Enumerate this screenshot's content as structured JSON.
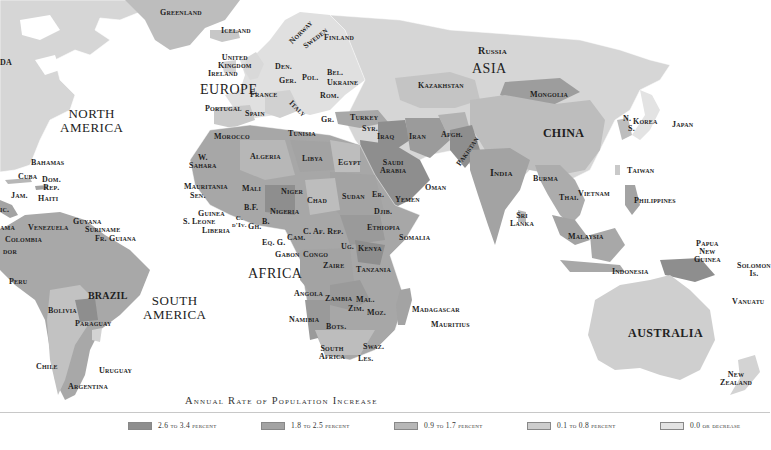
{
  "map": {
    "title": "Annual Rate of Population Increase",
    "colors": {
      "ocean": "#ffffff",
      "cat1": "#8e8e8e",
      "cat2": "#a3a3a3",
      "cat3": "#b7b7b7",
      "cat4": "#cdcdcd",
      "cat5": "#e3e3e3"
    },
    "continents": [
      {
        "id": "north-america",
        "text": "NORTH\nAMERICA"
      },
      {
        "id": "south-america",
        "text": "SOUTH\nAMERICA"
      },
      {
        "id": "europe",
        "text": "EUROPE"
      },
      {
        "id": "asia",
        "text": "ASIA"
      },
      {
        "id": "africa",
        "text": "AFRICA"
      },
      {
        "id": "australia",
        "text": "AUSTRALIA"
      }
    ],
    "countries": {
      "greenland": "Greenland",
      "iceland": "Iceland",
      "norway": "Norway",
      "sweden": "Sweden",
      "finland": "Finland",
      "uk": "United\nKingdom",
      "ireland": "Ireland",
      "den": "Den.",
      "ger": "Ger.",
      "pol": "Pol.",
      "bel": "Bel.",
      "ukraine": "Ukraine",
      "france": "France",
      "rom": "Rom.",
      "portugal": "Portugal",
      "spain": "Spain",
      "italy": "Italy",
      "gr": "Gr.",
      "turkey": "Turkey",
      "russia": "Russia",
      "kazakhstan": "Kazakhstan",
      "mongolia": "Mongolia",
      "china": "CHINA",
      "korea": "Korea",
      "n": "N.",
      "s": "S.",
      "japan": "Japan",
      "morocco": "Morocco",
      "tunisia": "Tunisia",
      "syr": "Syr.",
      "iraq": "Iraq",
      "iran": "Iran",
      "afgh": "Afgh.",
      "pakistan": "Pakistan",
      "india": "India",
      "w_sahara": "W.\nSahara",
      "algeria": "Algeria",
      "libya": "Libya",
      "egypt": "Egypt",
      "saudi": "Saudi\nArabia",
      "oman": "Oman",
      "yemen": "Yemen",
      "mauritania": "Mauritania",
      "sen": "Sen.",
      "mali": "Mali",
      "niger": "Niger",
      "chad": "Chad",
      "sudan": "Sudan",
      "er": "Er.",
      "djib": "Djib.",
      "guinea": "Guinea",
      "s_leone": "S. Leone",
      "liberia": "Liberia",
      "bf": "B.F.",
      "cdiv": "C.\nd'Iv.",
      "gh": "Gh.",
      "b": "B.",
      "nigeria": "Nigeria",
      "cam": "Cam.",
      "car": "C. Af. Rep.",
      "ethiopia": "Ethiopia",
      "somalia": "Somalia",
      "ug": "Ug.",
      "kenya": "Kenya",
      "eqg": "Eq. G.",
      "gabon": "Gabon",
      "congo": "Congo",
      "zaire": "Zaire",
      "tanzania": "Tanzania",
      "angola": "Angola",
      "zambia": "Zambia",
      "mal": "Mal.",
      "zim": "Zim.",
      "moz": "Moz.",
      "namibia": "Namibia",
      "bots": "Bots.",
      "south_africa": "South\nAfrica",
      "swaz": "Swaz.",
      "les": "Les.",
      "madagascar": "Madagascar",
      "mauritius": "Mauritius",
      "burma": "Burma",
      "thai": "Thai.",
      "vietnam": "Vietnam",
      "taiwan": "Taiwan",
      "philippines": "Philippines",
      "sri_lanka": "Sri\nLanka",
      "malaysia": "Malaysia",
      "indonesia": "Indonesia",
      "png": "Papua\nNew\nGuinea",
      "solomon": "Solomon\nIs.",
      "vanuatu": "Vanuatu",
      "new_zealand": "New\nZealand",
      "canada_frag": "DA",
      "bahamas": "Bahamas",
      "cuba": "Cuba",
      "dom_rep": "Dom.\nRep.",
      "haiti": "Haiti",
      "jam": "Jam.",
      "nic_frag": "ic.",
      "panama_frag": "ama",
      "venezuela": "Venezuela",
      "guyana": "Guyana",
      "suriname": "Suriname",
      "fr_guiana": "Fr. Guiana",
      "colombia": "Colombia",
      "ecuador_frag": "dor",
      "peru": "Peru",
      "brazil": "BRAZIL",
      "bolivia": "Bolivia",
      "paraguay": "Paraguay",
      "chile": "Chile",
      "uruguay": "Uruguay",
      "argentina": "Argentina"
    }
  },
  "legend": {
    "items": [
      {
        "label": "2.6 to 3.4 percent",
        "color": "#8e8e8e"
      },
      {
        "label": "1.8 to 2.5 percent",
        "color": "#a3a3a3"
      },
      {
        "label": "0.9 to 1.7 percent",
        "color": "#b7b7b7"
      },
      {
        "label": "0.1 to 0.8 percent",
        "color": "#cdcdcd"
      },
      {
        "label": "0.0 or decrease",
        "color": "#e3e3e3"
      }
    ]
  }
}
